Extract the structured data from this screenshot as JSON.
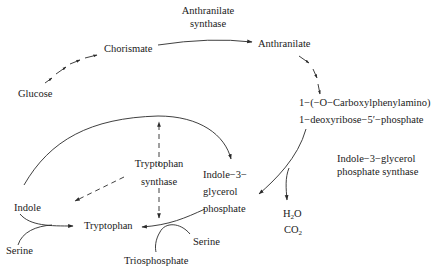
{
  "diagram": {
    "nodes": {
      "glucose": "Glucose",
      "chorismate": "Chorismate",
      "anthranilate_synthase_line1": "Anthranilate",
      "anthranilate_synthase_line2": "synthase",
      "anthranilate": "Anthranilate",
      "cdrp_line1": "1−(−O−Carboxylphenylamino)",
      "cdrp_line2": "1−deoxyribose−5′−phosphate",
      "igps_line1": "Indole−3−glycerol",
      "igps_line2": "phosphate  synthase",
      "igp_line1": "Indole−3−",
      "igp_line2": "glycerol",
      "igp_line3": "phosphate",
      "tryptophan_synthase_line1": "Tryptophan",
      "tryptophan_synthase_line2": "synthase",
      "indole": "Indole",
      "tryptophan": "Tryptophan",
      "serine_left": "Serine",
      "serine_right": "Serine",
      "triosphosphate": "Triosphosphate",
      "h2o_prefix": "H",
      "h2o_sub": "2",
      "h2o_suffix": "O",
      "co2_prefix": "CO",
      "co2_sub": "2"
    },
    "edges": [
      {
        "from": "Glucose",
        "to": "Chorismate",
        "style": "dashed-multi-step"
      },
      {
        "from": "Chorismate",
        "to": "Anthranilate",
        "style": "solid",
        "enzyme": "Anthranilate synthase"
      },
      {
        "from": "Anthranilate",
        "to": "1-(-O-Carboxylphenylamino) 1-deoxyribose-5'-phosphate",
        "style": "dashed-multi-step"
      },
      {
        "from": "1-(-O-Carboxylphenylamino) 1-deoxyribose-5'-phosphate",
        "to": "Indole-3-glycerol phosphate",
        "style": "solid",
        "enzyme": "Indole-3-glycerol phosphate synthase",
        "byproducts": [
          "H2O",
          "CO2"
        ]
      },
      {
        "from": "Indole",
        "to": "Indole-3-glycerol phosphate",
        "style": "solid-arc"
      },
      {
        "from": "Indole + Serine",
        "to": "Tryptophan",
        "style": "solid"
      },
      {
        "from": "Indole-3-glycerol phosphate + Serine",
        "to": "Tryptophan",
        "style": "solid",
        "byproducts": [
          "Triosphosphate"
        ]
      },
      {
        "from": "Tryptophan synthase",
        "to": "Tryptophan",
        "style": "dashed"
      },
      {
        "from": "Tryptophan synthase",
        "to": "Indole arc",
        "style": "dashed"
      }
    ],
    "colors": {
      "line": "#2a2a2a",
      "text": "#1a1a1a",
      "background": "#ffffff"
    }
  }
}
